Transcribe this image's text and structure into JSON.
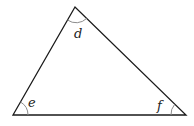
{
  "diagram": {
    "type": "triangle",
    "vertices": {
      "apex": {
        "x": 75,
        "y": 7
      },
      "bottom_left": {
        "x": 13,
        "y": 115
      },
      "bottom_right": {
        "x": 186,
        "y": 115
      }
    },
    "angles": [
      {
        "vertex": "apex",
        "label": "d"
      },
      {
        "vertex": "bottom_left",
        "label": "e"
      },
      {
        "vertex": "bottom_right",
        "label": "f"
      }
    ],
    "colors": {
      "edge": "#1a1a1a",
      "arc": "#8c8c8c"
    }
  }
}
